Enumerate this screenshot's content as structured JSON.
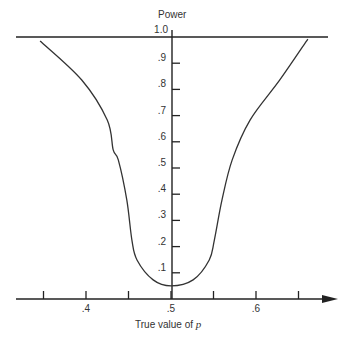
{
  "chart_data": {
    "type": "line",
    "title": "",
    "ylabel": "Power",
    "xlabel": "True value of p",
    "xlabel_italic_part": "p",
    "xlabel_prefix": "True value of ",
    "xlim": [
      0.33,
      0.68
    ],
    "ylim": [
      0,
      1.0
    ],
    "x_ticks": [
      0.35,
      0.4,
      0.45,
      0.5,
      0.55,
      0.6,
      0.65
    ],
    "x_tick_labels": [
      {
        "value": 0.4,
        "label": ".4"
      },
      {
        "value": 0.5,
        "label": ".5"
      },
      {
        "value": 0.6,
        "label": ".6"
      }
    ],
    "y_tick_labels": [
      {
        "value": 1.0,
        "label": "1.0"
      },
      {
        "value": 0.9,
        "label": ".9"
      },
      {
        "value": 0.8,
        "label": ".8"
      },
      {
        "value": 0.7,
        "label": ".7"
      },
      {
        "value": 0.6,
        "label": ".6"
      },
      {
        "value": 0.5,
        "label": ".5"
      },
      {
        "value": 0.4,
        "label": ".4"
      },
      {
        "value": 0.3,
        "label": ".3"
      },
      {
        "value": 0.2,
        "label": ".2"
      },
      {
        "value": 0.1,
        "label": ".1"
      }
    ],
    "reference_line": {
      "y": 1.0,
      "x_from": 0.33,
      "x_to": 0.685
    },
    "grid": false,
    "legend": null,
    "series": [
      {
        "name": "Power curve",
        "x": [
          0.346,
          0.395,
          0.425,
          0.432,
          0.438,
          0.448,
          0.454,
          0.46,
          0.479,
          0.5,
          0.526,
          0.545,
          0.551,
          0.56,
          0.572,
          0.593,
          0.628,
          0.661
        ],
        "y": [
          0.985,
          0.836,
          0.683,
          0.569,
          0.531,
          0.378,
          0.225,
          0.149,
          0.073,
          0.05,
          0.073,
          0.149,
          0.225,
          0.378,
          0.531,
          0.683,
          0.836,
          0.992
        ]
      }
    ]
  },
  "labels": {
    "y_axis_title": "Power",
    "x_axis_prefix": "True value of ",
    "x_axis_var": "p"
  }
}
